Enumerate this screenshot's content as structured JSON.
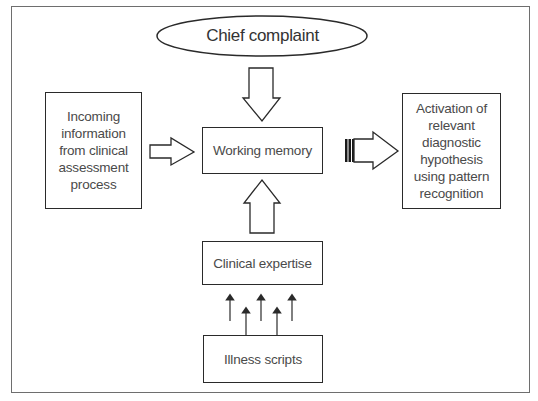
{
  "diagram": {
    "chief_complaint": "Chief complaint",
    "incoming_info": {
      "lines": [
        "Incoming",
        "information",
        "from clinical",
        "assessment",
        "process"
      ]
    },
    "working_memory": "Working memory",
    "activation": {
      "lines": [
        "Activation of",
        "relevant",
        "diagnostic",
        "hypothesis",
        "using pattern",
        "recognition"
      ]
    },
    "clinical_expertise": "Clinical expertise",
    "illness_scripts": "Illness scripts"
  },
  "colors": {
    "stroke": "#2a2a2a",
    "frame": "#6e6e6e",
    "text": "#4a4a4a",
    "background": "#ffffff"
  }
}
